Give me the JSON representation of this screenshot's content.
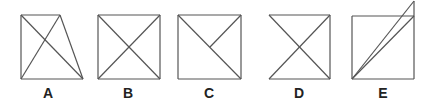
{
  "figures": [
    {
      "label": "A",
      "label_x": 48,
      "lines": [
        [
          21,
          15,
          21,
          79
        ],
        [
          21,
          15,
          60,
          15
        ],
        [
          21,
          79,
          83,
          79
        ],
        [
          60,
          15,
          83,
          79
        ],
        [
          21,
          15,
          83,
          79
        ],
        [
          21,
          79,
          60,
          15
        ]
      ]
    },
    {
      "label": "B",
      "label_x": 128,
      "lines": [
        [
          98,
          15,
          160,
          15
        ],
        [
          160,
          15,
          160,
          79
        ],
        [
          160,
          79,
          98,
          79
        ],
        [
          98,
          79,
          98,
          15
        ],
        [
          98,
          15,
          160,
          79
        ],
        [
          98,
          79,
          160,
          15
        ]
      ]
    },
    {
      "label": "C",
      "label_x": 209,
      "lines": [
        [
          178,
          15,
          241,
          15
        ],
        [
          241,
          15,
          241,
          79
        ],
        [
          241,
          79,
          178,
          79
        ],
        [
          178,
          79,
          178,
          15
        ],
        [
          178,
          15,
          241,
          79
        ],
        [
          241,
          15,
          210,
          47
        ]
      ]
    },
    {
      "label": "D",
      "label_x": 299,
      "lines": [
        [
          269,
          15,
          330,
          15
        ],
        [
          330,
          15,
          330,
          79
        ],
        [
          330,
          79,
          269,
          79
        ],
        [
          269,
          15,
          330,
          79
        ],
        [
          269,
          79,
          330,
          15
        ]
      ]
    },
    {
      "label": "E",
      "label_x": 383,
      "lines": [
        [
          352,
          16,
          414,
          16
        ],
        [
          414,
          1,
          414,
          79
        ],
        [
          414,
          79,
          352,
          79
        ],
        [
          352,
          79,
          352,
          16
        ],
        [
          352,
          79,
          414,
          16
        ],
        [
          352,
          79,
          414,
          1
        ]
      ]
    }
  ],
  "style": {
    "stroke": "#555555",
    "stroke_width": 1.2
  }
}
